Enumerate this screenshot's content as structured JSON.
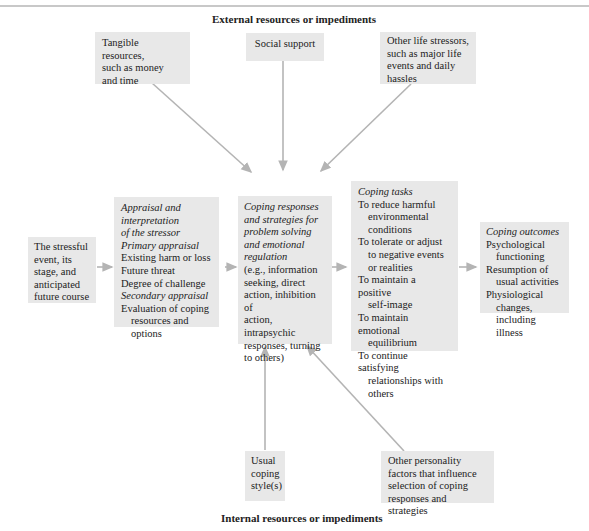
{
  "diagram": {
    "top_label": "External resources or impediments",
    "bottom_label": "Internal resources or impediments",
    "external": {
      "tangible": [
        "Tangible resources,",
        "such as money",
        "and time"
      ],
      "social": [
        "Social support"
      ],
      "stressors": [
        "Other life stressors,",
        "such as major life",
        "events and daily",
        "hassles"
      ]
    },
    "event": [
      "The stressful",
      "event, its",
      "stage, and",
      "anticipated",
      "future course"
    ],
    "appraisal": {
      "title": [
        "Appraisal and",
        "interpretation",
        "of the stressor"
      ],
      "primary_label": "Primary appraisal",
      "primary_items": [
        "Existing harm or loss",
        "Future threat",
        "Degree of challenge"
      ],
      "secondary_label": "Secondary appraisal",
      "secondary_items": [
        "Evaluation of coping",
        "resources and",
        "options"
      ]
    },
    "coping_responses": {
      "title": [
        "Coping responses",
        "and strategies for",
        "problem solving",
        "and emotional",
        "regulation"
      ],
      "body": [
        "(e.g., information",
        "seeking, direct",
        "action, inhibition of",
        "action, intrapsychic",
        "responses, turning",
        "to others)"
      ]
    },
    "coping_tasks": {
      "title": "Coping tasks",
      "items": [
        [
          "To reduce harmful",
          "environmental",
          "conditions"
        ],
        [
          "To tolerate or adjust",
          "to negative events",
          "or realities"
        ],
        [
          "To maintain a positive",
          "self-image"
        ],
        [
          "To maintain emotional",
          "equilibrium"
        ],
        [
          "To continue satisfying",
          "relationships with",
          "others"
        ]
      ]
    },
    "coping_outcomes": {
      "title": "Coping outcomes",
      "items": [
        [
          "Psychological",
          "functioning"
        ],
        [
          "Resumption of",
          "usual activities"
        ],
        [
          "Physiological",
          "changes,",
          "including",
          "illness"
        ]
      ]
    },
    "internal": {
      "usual": [
        "Usual",
        "coping",
        "style(s)"
      ],
      "personality": [
        "Other personality",
        "factors that influence",
        "selection of coping",
        "responses and strategies"
      ]
    },
    "colors": {
      "box_fill": "#e8e8e8",
      "arrow": "#b4b4b4",
      "text": "#222222"
    }
  }
}
